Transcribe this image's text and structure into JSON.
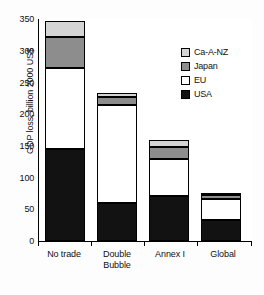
{
  "chart_data": {
    "type": "bar",
    "stacked": true,
    "title": "",
    "xlabel": "",
    "ylabel": "GDP loss, billion 2000 US$",
    "categories": [
      "No trade",
      "Double Bubble",
      "Annex I",
      "Global"
    ],
    "category_lines": [
      [
        "No trade"
      ],
      [
        "Double",
        "Bubble"
      ],
      [
        "Annex I"
      ],
      [
        "Global"
      ]
    ],
    "series": [
      {
        "name": "USA",
        "color": "#121212",
        "values": [
          145,
          60,
          71,
          33
        ]
      },
      {
        "name": "EU",
        "color": "#ffffff",
        "values": [
          127,
          155,
          59,
          34
        ]
      },
      {
        "name": "Japan",
        "color": "#8d8d8d",
        "values": [
          49,
          12,
          18,
          5
        ]
      },
      {
        "name": "Ca-A-NZ",
        "color": "#d4d4d4",
        "values": [
          26,
          7,
          12,
          4
        ]
      }
    ],
    "totals": [
      347,
      234,
      160,
      76
    ],
    "ylim": [
      0,
      350
    ],
    "yticks": [
      0,
      50,
      100,
      150,
      200,
      250,
      300,
      350
    ],
    "ytick_labels": [
      "0",
      "50",
      "100",
      "150",
      "200",
      "250",
      "300",
      "350"
    ],
    "grid": false,
    "legend_position": "upper right",
    "legend_entries": [
      "Ca-A-NZ",
      "Japan",
      "EU",
      "USA"
    ]
  }
}
